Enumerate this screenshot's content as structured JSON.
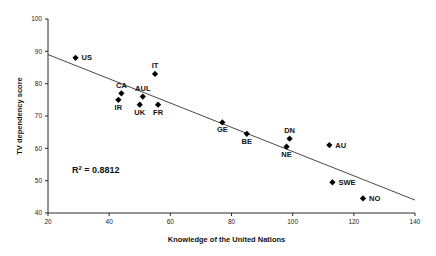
{
  "chart_data": {
    "type": "scatter",
    "title": "",
    "xlabel": "Knowledge of the United Nations",
    "ylabel": "TV dependency score",
    "xlim": [
      20,
      140
    ],
    "ylim": [
      40,
      100
    ],
    "xticks": [
      20,
      40,
      60,
      80,
      100,
      120,
      140
    ],
    "yticks": [
      40,
      50,
      60,
      70,
      80,
      90,
      100
    ],
    "grid": false,
    "legend": "none",
    "annotations": [
      {
        "name": "r-squared",
        "text": "R",
        "superscript": "2",
        "rest": " = 0.8812",
        "full": "R2 = 0.8812",
        "value": 0.8812
      }
    ],
    "trendline": {
      "name": "linear-fit",
      "x": [
        20,
        140
      ],
      "y": [
        89.0,
        44.0
      ]
    },
    "points": [
      {
        "label": "US",
        "x": 29,
        "y": 88.0,
        "label_pos": "right"
      },
      {
        "label": "IT",
        "x": 55,
        "y": 83.0,
        "label_pos": "above"
      },
      {
        "label": "CA",
        "x": 44,
        "y": 77.0,
        "label_pos": "above"
      },
      {
        "label": "AUL",
        "x": 51,
        "y": 76.0,
        "label_pos": "above"
      },
      {
        "label": "IR",
        "x": 43,
        "y": 75.0,
        "label_pos": "below"
      },
      {
        "label": "UK",
        "x": 50,
        "y": 73.5,
        "label_pos": "below"
      },
      {
        "label": "FR",
        "x": 56,
        "y": 73.5,
        "label_pos": "below"
      },
      {
        "label": "GE",
        "x": 77,
        "y": 68.0,
        "label_pos": "below"
      },
      {
        "label": "BE",
        "x": 85,
        "y": 64.5,
        "label_pos": "below"
      },
      {
        "label": "DN",
        "x": 99,
        "y": 63.0,
        "label_pos": "above"
      },
      {
        "label": "AU",
        "x": 112,
        "y": 61.0,
        "label_pos": "right"
      },
      {
        "label": "NE",
        "x": 98,
        "y": 60.5,
        "label_pos": "below"
      },
      {
        "label": "SWE",
        "x": 113,
        "y": 49.5,
        "label_pos": "right"
      },
      {
        "label": "NO",
        "x": 123,
        "y": 44.5,
        "label_pos": "right"
      }
    ]
  },
  "colors": {
    "marker": "#000000",
    "axis": "#2a2a2a",
    "trendline": "#333333",
    "background": "#ffffff"
  }
}
